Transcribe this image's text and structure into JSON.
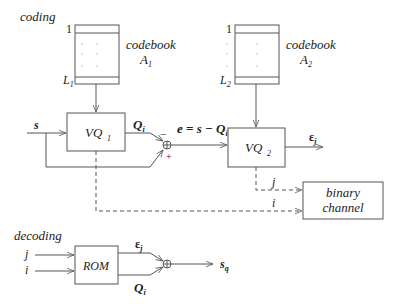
{
  "sections": {
    "coding": "coding",
    "decoding": "decoding"
  },
  "codebook1": {
    "title": "codebook",
    "name": "A",
    "sub": "1",
    "first_index": "1",
    "last_index": "L",
    "last_sub": "1"
  },
  "codebook2": {
    "title": "codebook",
    "name": "A",
    "sub": "2",
    "first_index": "1",
    "last_index": "L",
    "last_sub": "2"
  },
  "blocks": {
    "vq1": {
      "label": "VQ",
      "sub": "1"
    },
    "vq2": {
      "label": "VQ",
      "sub": "2"
    },
    "channel": {
      "line1": "binary",
      "line2": "channel"
    },
    "rom": {
      "label": "ROM"
    }
  },
  "signals": {
    "input": "s",
    "q1_out": "Q",
    "q1_sub": "i",
    "error": "e = s − Q",
    "error_sub": "i",
    "minus": "−",
    "plus": "+",
    "eps_out": "ε",
    "eps_sub": "j",
    "index_j": "j",
    "index_i": "i",
    "dec_j": "j",
    "dec_i": "i",
    "dec_eps": "ε",
    "dec_eps_sub": "j",
    "dec_q": "Q",
    "dec_q_sub": "i",
    "output": "s",
    "output_sub": "q"
  },
  "icons": {
    "sum": "summing-junction-icon",
    "arrow": "arrow-head-icon"
  },
  "colors": {
    "line": "#555555",
    "text": "#222222",
    "background": "#ffffff"
  }
}
